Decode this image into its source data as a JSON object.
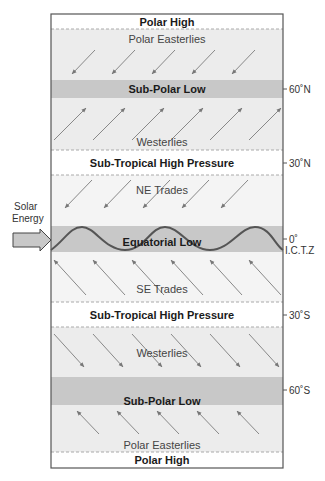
{
  "colors": {
    "light_band": "#ececec",
    "white_band": "#ffffff",
    "low_band": "#c8c8c8",
    "border": "#555555",
    "arrow": "#888888",
    "dashed": "#aaaaaa",
    "wave": "#555555"
  },
  "bands": [
    {
      "id": "polar-high-n",
      "label": "Polar High",
      "bold": true
    },
    {
      "id": "polar-easterlies-n",
      "label": "Polar Easterlies",
      "bold": false
    },
    {
      "id": "sub-polar-low-n",
      "label": "Sub-Polar Low",
      "bold": true
    },
    {
      "id": "westerlies-n",
      "label": "Westerlies",
      "bold": false
    },
    {
      "id": "sub-tropical-high-n",
      "label": "Sub-Tropical High Pressure",
      "bold": true
    },
    {
      "id": "ne-trades",
      "label": "NE Trades",
      "bold": false
    },
    {
      "id": "equatorial-low",
      "label": "Equatorial Low",
      "bold": true
    },
    {
      "id": "se-trades",
      "label": "SE Trades",
      "bold": false
    },
    {
      "id": "sub-tropical-high-s",
      "label": "Sub-Tropical High Pressure",
      "bold": true
    },
    {
      "id": "westerlies-s",
      "label": "Westerlies",
      "bold": false
    },
    {
      "id": "sub-polar-low-s",
      "label": "Sub-Polar Low",
      "bold": true
    },
    {
      "id": "polar-easterlies-s",
      "label": "Polar Easterlies",
      "bold": false
    },
    {
      "id": "polar-high-s",
      "label": "Polar High",
      "bold": true
    }
  ],
  "latitudes": {
    "n60": "60˚N",
    "n30": "30˚N",
    "eq": "0˚",
    "itcz": "I.C.T.Z",
    "s30": "30˚S",
    "s60": "60˚S"
  },
  "solar": {
    "line1": "Solar",
    "line2": "Energy"
  }
}
